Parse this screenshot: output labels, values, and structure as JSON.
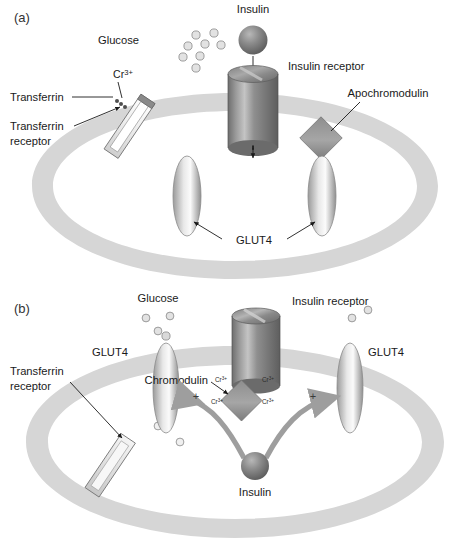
{
  "figure": {
    "background": "#ffffff",
    "membrane_color": "#d6d6d6",
    "ink_color": "#1a1a1a"
  },
  "panel_a": {
    "panel_label": "(a)",
    "labels": {
      "insulin": "Insulin",
      "insulin_receptor": "Insulin receptor",
      "glucose": "Glucose",
      "chromium_ion": "Cr",
      "chromium_charge": "3+",
      "transferrin": "Transferrin",
      "transferrin_receptor": "Transferrin\nreceptor",
      "transferrin_receptor_line1": "Transferrin",
      "transferrin_receptor_line2": "receptor",
      "apochromodulin": "Apochromodulin",
      "glut4": "GLUT4"
    },
    "glucose_dots": [
      {
        "cx": 196,
        "cy": 35
      },
      {
        "cx": 214,
        "cy": 33
      },
      {
        "cx": 188,
        "cy": 46
      },
      {
        "cx": 205,
        "cy": 44
      },
      {
        "cx": 221,
        "cy": 45
      },
      {
        "cx": 183,
        "cy": 57
      },
      {
        "cx": 200,
        "cy": 56
      },
      {
        "cx": 196,
        "cy": 68
      }
    ],
    "glut4_count": 2,
    "chromodulin_state": "apo (unbound, no Cr)"
  },
  "panel_b": {
    "panel_label": "(b)",
    "labels": {
      "glucose": "Glucose",
      "insulin_receptor": "Insulin receptor",
      "glut4_left": "GLUT4",
      "glut4_right": "GLUT4",
      "chromodulin": "Chromodulin",
      "transferrin_receptor_line1": "Transferrin",
      "transferrin_receptor_line2": "receptor",
      "insulin": "Insulin",
      "chromium_ion": "Cr",
      "chromium_charge": "3+",
      "plus_sign": "+"
    },
    "chromium_labels": [
      {
        "id": "cr-top-left",
        "text": "Cr",
        "charge": "3+",
        "x": 208,
        "y": 377
      },
      {
        "id": "cr-top-right",
        "text": "Cr",
        "charge": "3+",
        "x": 266,
        "y": 377
      },
      {
        "id": "cr-bottom-left",
        "text": "Cr",
        "charge": "3+",
        "x": 204,
        "y": 401
      },
      {
        "id": "cr-bottom-right",
        "text": "Cr",
        "charge": "3+",
        "x": 263,
        "y": 401
      }
    ],
    "plus_signs": [
      {
        "id": "plus-left",
        "x": 178,
        "y": 396
      },
      {
        "id": "plus-right",
        "x": 300,
        "y": 396
      }
    ],
    "glucose_dots_outside": [
      {
        "cx": 146,
        "cy": 318
      },
      {
        "cx": 170,
        "cy": 316
      },
      {
        "cx": 352,
        "cy": 318
      },
      {
        "cx": 368,
        "cy": 310
      },
      {
        "cx": 158,
        "cy": 331
      }
    ],
    "glucose_dots_inside": [
      {
        "cx": 158,
        "cy": 426
      },
      {
        "cx": 180,
        "cy": 442
      },
      {
        "cx": 347,
        "cy": 425
      }
    ],
    "glut4_count": 2,
    "chromodulin_state": "holo (4 Cr3+ bound)",
    "arrow_direction_left": "leftward curved arrow from insulin to left GLUT4",
    "arrow_direction_right": "rightward curved arrow from insulin to right GLUT4"
  }
}
